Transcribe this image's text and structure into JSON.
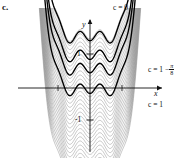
{
  "figure": {
    "part_label": "c.",
    "axes": {
      "x_name": "x",
      "y_name": "y",
      "y_ticks": [
        {
          "value": 1,
          "label": "1"
        },
        {
          "value": -1,
          "label": "-1"
        }
      ],
      "x_ticks": [
        {
          "value": -1,
          "label": ""
        },
        {
          "value": 1,
          "label": ""
        }
      ]
    },
    "curve_labels": {
      "top": "c = 0",
      "middle_prefix": "c = 1 −",
      "middle_frac_num": "π",
      "middle_frac_den": "8",
      "middle_full": "c = 1 − π/8",
      "bottom": "c = 1"
    },
    "colors": {
      "highlight": "#000000",
      "family": "#8c8c8c",
      "axis": "#111111",
      "background": "#ffffff"
    }
  },
  "chart_data": {
    "type": "line",
    "title": "",
    "subtitle": "",
    "xlabel": "x",
    "ylabel": "y",
    "xlim": [
      -2.05,
      2.05
    ],
    "ylim": [
      -2.6,
      2.2
    ],
    "grid": false,
    "legend": "inline-annotations",
    "family_function": "F(x) = x^2 - (1/8)*sin(4*pi*x)/(pi) approximated as x^2 shaped well with ripples",
    "constants_shown": [
      0,
      0.607,
      1
    ],
    "constant_labels": [
      "c = 0",
      "c = 1 - π/8",
      "c = 1"
    ],
    "family_count": 34,
    "c_min": -2.4,
    "c_max": 1.6,
    "annotations": [
      {
        "text": "c = 0",
        "x": 0.55,
        "y": 2.05,
        "bold_curve": true
      },
      {
        "text": "c = 1 − π/8",
        "x": 2.0,
        "y": 0.55,
        "bold_curve": true
      },
      {
        "text": "c = 1",
        "x": 2.0,
        "y": -0.35,
        "bold_curve": true
      }
    ]
  }
}
